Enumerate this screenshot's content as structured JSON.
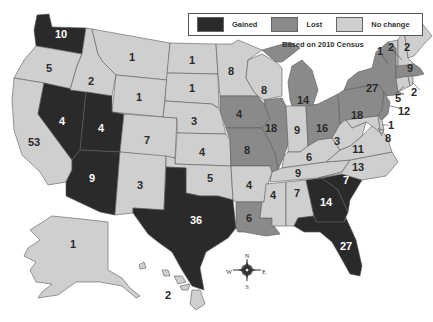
{
  "legend": {
    "items": [
      {
        "label": "Gained",
        "color": "#2a2a2a"
      },
      {
        "label": "Lost",
        "color": "#8a8a8a"
      },
      {
        "label": "No change",
        "color": "#cfcfcf"
      }
    ]
  },
  "note": "Based on 2010 Census",
  "compass": {
    "n": "N",
    "s": "S",
    "e": "E",
    "w": "W"
  },
  "colors": {
    "gained": "#2a2a2a",
    "lost": "#8a8a8a",
    "no_change": "#cfcfcf",
    "border": "#5a5a5a"
  },
  "states": [
    {
      "id": "WA",
      "seats": "10",
      "status": "gained"
    },
    {
      "id": "OR",
      "seats": "5",
      "status": "no_change"
    },
    {
      "id": "CA",
      "seats": "53",
      "status": "no_change"
    },
    {
      "id": "NV",
      "seats": "4",
      "status": "gained"
    },
    {
      "id": "ID",
      "seats": "2",
      "status": "no_change"
    },
    {
      "id": "MT",
      "seats": "1",
      "status": "no_change"
    },
    {
      "id": "WY",
      "seats": "1",
      "status": "no_change"
    },
    {
      "id": "UT",
      "seats": "4",
      "status": "gained"
    },
    {
      "id": "AZ",
      "seats": "9",
      "status": "gained"
    },
    {
      "id": "CO",
      "seats": "7",
      "status": "no_change"
    },
    {
      "id": "NM",
      "seats": "3",
      "status": "no_change"
    },
    {
      "id": "ND",
      "seats": "1",
      "status": "no_change"
    },
    {
      "id": "SD",
      "seats": "1",
      "status": "no_change"
    },
    {
      "id": "NE",
      "seats": "3",
      "status": "no_change"
    },
    {
      "id": "KS",
      "seats": "4",
      "status": "no_change"
    },
    {
      "id": "OK",
      "seats": "5",
      "status": "no_change"
    },
    {
      "id": "TX",
      "seats": "36",
      "status": "gained"
    },
    {
      "id": "MN",
      "seats": "8",
      "status": "no_change"
    },
    {
      "id": "IA",
      "seats": "4",
      "status": "lost"
    },
    {
      "id": "MO",
      "seats": "8",
      "status": "lost"
    },
    {
      "id": "AR",
      "seats": "4",
      "status": "no_change"
    },
    {
      "id": "LA",
      "seats": "6",
      "status": "lost"
    },
    {
      "id": "WI",
      "seats": "8",
      "status": "no_change"
    },
    {
      "id": "IL",
      "seats": "18",
      "status": "lost"
    },
    {
      "id": "MI",
      "seats": "14",
      "status": "lost"
    },
    {
      "id": "IN",
      "seats": "9",
      "status": "no_change"
    },
    {
      "id": "OH",
      "seats": "16",
      "status": "lost"
    },
    {
      "id": "KY",
      "seats": "6",
      "status": "no_change"
    },
    {
      "id": "TN",
      "seats": "9",
      "status": "no_change"
    },
    {
      "id": "MS",
      "seats": "4",
      "status": "no_change"
    },
    {
      "id": "AL",
      "seats": "7",
      "status": "no_change"
    },
    {
      "id": "GA",
      "seats": "14",
      "status": "gained"
    },
    {
      "id": "FL",
      "seats": "27",
      "status": "gained"
    },
    {
      "id": "SC",
      "seats": "7",
      "status": "gained"
    },
    {
      "id": "NC",
      "seats": "13",
      "status": "no_change"
    },
    {
      "id": "VA",
      "seats": "11",
      "status": "no_change"
    },
    {
      "id": "WV",
      "seats": "3",
      "status": "no_change"
    },
    {
      "id": "PA",
      "seats": "18",
      "status": "lost"
    },
    {
      "id": "NY",
      "seats": "27",
      "status": "lost"
    },
    {
      "id": "NJ",
      "seats": "12",
      "status": "lost"
    },
    {
      "id": "DE",
      "seats": "1",
      "status": "no_change"
    },
    {
      "id": "MD",
      "seats": "8",
      "status": "no_change"
    },
    {
      "id": "CT",
      "seats": "5",
      "status": "no_change"
    },
    {
      "id": "RI",
      "seats": "2",
      "status": "no_change"
    },
    {
      "id": "MA",
      "seats": "9",
      "status": "lost"
    },
    {
      "id": "VT",
      "seats": "1",
      "status": "no_change"
    },
    {
      "id": "NH",
      "seats": "2",
      "status": "no_change"
    },
    {
      "id": "ME",
      "seats": "2",
      "status": "no_change"
    },
    {
      "id": "AK",
      "seats": "1",
      "status": "no_change"
    },
    {
      "id": "HI",
      "seats": "2",
      "status": "no_change"
    }
  ]
}
